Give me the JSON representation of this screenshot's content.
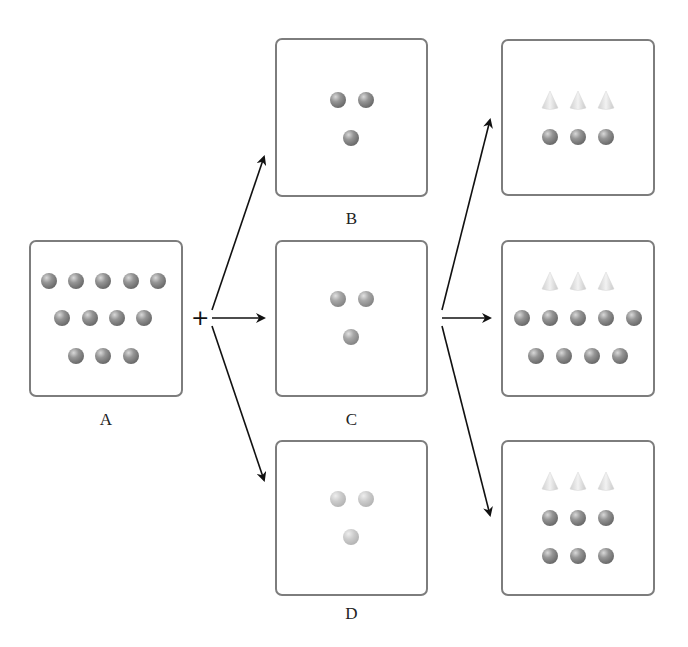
{
  "diagram": {
    "operator": "+",
    "colors": {
      "box_border": "#7d7d7d",
      "sphere": "#8a8a8a",
      "sphere_light": "#c4c4c4",
      "cone": "#dcdcdc",
      "arrow": "#111111"
    },
    "boxes": [
      {
        "id": "A",
        "label": "A",
        "x": 29,
        "y": 240,
        "w": 154,
        "h": 157,
        "label_y": 410,
        "cones": [],
        "spheres": [
          [
            49,
            281
          ],
          [
            76,
            281
          ],
          [
            103,
            281
          ],
          [
            131,
            281
          ],
          [
            158,
            281
          ],
          [
            62,
            318
          ],
          [
            90,
            318
          ],
          [
            117,
            318
          ],
          [
            144,
            318
          ],
          [
            76,
            356
          ],
          [
            103,
            356
          ],
          [
            131,
            356
          ]
        ],
        "sphere_style": "dark"
      },
      {
        "id": "B",
        "label": "B",
        "x": 275,
        "y": 38,
        "w": 153,
        "h": 159,
        "label_y": 209,
        "cones": [],
        "spheres": [
          [
            338,
            100
          ],
          [
            366,
            100
          ],
          [
            351,
            138
          ]
        ],
        "sphere_style": "dark"
      },
      {
        "id": "C",
        "label": "C",
        "x": 275,
        "y": 240,
        "w": 153,
        "h": 157,
        "label_y": 410,
        "cones": [],
        "spheres": [
          [
            338,
            299
          ],
          [
            366,
            299
          ],
          [
            351,
            337
          ]
        ],
        "sphere_style": "medium"
      },
      {
        "id": "D",
        "label": "D",
        "x": 275,
        "y": 440,
        "w": 153,
        "h": 156,
        "label_y": 604,
        "cones": [],
        "spheres": [
          [
            338,
            499
          ],
          [
            366,
            499
          ],
          [
            351,
            537
          ]
        ],
        "sphere_style": "light"
      },
      {
        "id": "R1",
        "label": "",
        "x": 501,
        "y": 39,
        "w": 154,
        "h": 157,
        "label_y": null,
        "cones": [
          [
            550,
            100
          ],
          [
            578,
            100
          ],
          [
            606,
            100
          ]
        ],
        "spheres": [
          [
            550,
            137
          ],
          [
            578,
            137
          ],
          [
            606,
            137
          ]
        ],
        "sphere_style": "dark"
      },
      {
        "id": "R2",
        "label": "",
        "x": 501,
        "y": 240,
        "w": 154,
        "h": 157,
        "label_y": null,
        "cones": [
          [
            550,
            281
          ],
          [
            578,
            281
          ],
          [
            606,
            281
          ]
        ],
        "spheres": [
          [
            522,
            318
          ],
          [
            550,
            318
          ],
          [
            578,
            318
          ],
          [
            606,
            318
          ],
          [
            634,
            318
          ],
          [
            536,
            356
          ],
          [
            564,
            356
          ],
          [
            592,
            356
          ],
          [
            620,
            356
          ]
        ],
        "sphere_style": "dark"
      },
      {
        "id": "R3",
        "label": "",
        "x": 501,
        "y": 440,
        "w": 154,
        "h": 156,
        "label_y": null,
        "cones": [
          [
            550,
            481
          ],
          [
            578,
            481
          ],
          [
            606,
            481
          ]
        ],
        "spheres": [
          [
            550,
            518
          ],
          [
            578,
            518
          ],
          [
            606,
            518
          ],
          [
            550,
            556
          ],
          [
            578,
            556
          ],
          [
            606,
            556
          ]
        ],
        "sphere_style": "dark"
      }
    ],
    "arrows": [
      {
        "from": [
          212,
          310
        ],
        "to": [
          264,
          157
        ]
      },
      {
        "from": [
          212,
          318
        ],
        "to": [
          264,
          318
        ]
      },
      {
        "from": [
          212,
          326
        ],
        "to": [
          264,
          480
        ]
      },
      {
        "from": [
          442,
          310
        ],
        "to": [
          490,
          120
        ]
      },
      {
        "from": [
          442,
          318
        ],
        "to": [
          490,
          318
        ]
      },
      {
        "from": [
          442,
          326
        ],
        "to": [
          490,
          515
        ]
      }
    ],
    "plus_position": [
      191,
      307
    ]
  }
}
